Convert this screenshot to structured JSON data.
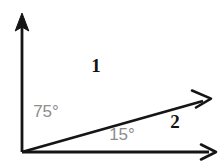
{
  "figure": {
    "background_color": "#ffffff",
    "width": 223,
    "height": 165,
    "stroke_color": "#151515",
    "label_dark_color": "#111111",
    "label_gray_color": "#8d8d8d"
  },
  "geometry": {
    "vertex": {
      "x": 22,
      "y": 152
    },
    "rays": [
      {
        "name": "vertical-ray",
        "from": {
          "x": 22,
          "y": 152
        },
        "to": {
          "x": 22,
          "y": 14
        },
        "arrowhead": "solid",
        "angle_from_horizontal_deg": 90
      },
      {
        "name": "diagonal-ray",
        "from": {
          "x": 22,
          "y": 152
        },
        "to": {
          "x": 210,
          "y": 99
        },
        "arrowhead": "open",
        "angle_from_horizontal_deg": 15
      },
      {
        "name": "horizontal-ray",
        "from": {
          "x": 22,
          "y": 152
        },
        "to": {
          "x": 216,
          "y": 152
        },
        "arrowhead": "open",
        "angle_from_horizontal_deg": 0
      }
    ]
  },
  "labels": {
    "region_one": {
      "text": "1",
      "x": 96,
      "y": 68
    },
    "region_two": {
      "text": "2",
      "x": 175,
      "y": 124
    },
    "angle_upper": {
      "text": "75°",
      "x": 46,
      "y": 113
    },
    "angle_lower": {
      "text": "15°",
      "x": 122,
      "y": 136
    }
  }
}
